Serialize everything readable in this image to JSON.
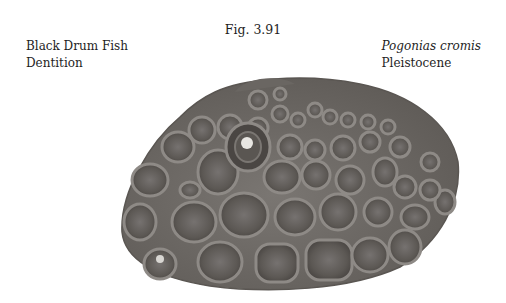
{
  "figure": {
    "number": "Fig. 3.91"
  },
  "caption_left": {
    "line1": "Black Drum Fish",
    "line2": "Dentition"
  },
  "caption_right": {
    "species": "Pogonias cromis",
    "epoch": "Pleistocene"
  },
  "photo": {
    "subject": "fossil dentition plate",
    "base_color": "#6e6a66",
    "tooth_color": "#5a5652",
    "rim_color": "#8c8884"
  }
}
